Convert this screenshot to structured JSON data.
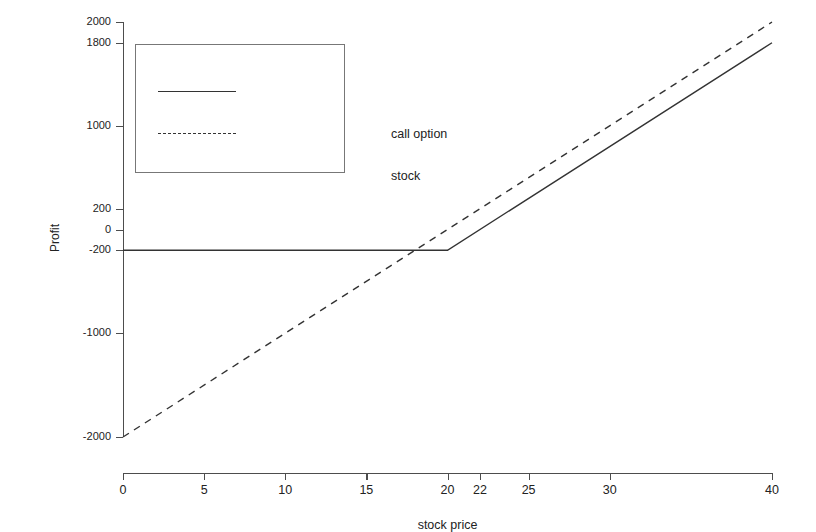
{
  "chart_data": {
    "type": "line",
    "title": "",
    "xlabel": "stock price",
    "ylabel": "Profit",
    "xlim": [
      0,
      40
    ],
    "ylim": [
      -2000,
      2000
    ],
    "grid": false,
    "legend_position": "upper left",
    "x_ticks": [
      0,
      5,
      10,
      15,
      20,
      22,
      25,
      30,
      40
    ],
    "x_tick_labels": [
      "0",
      "5",
      "10",
      "15",
      "20",
      "22",
      "25",
      "30",
      "40"
    ],
    "y_ticks": [
      2000,
      1800,
      1000,
      200,
      0,
      -200,
      -1000,
      -2000
    ],
    "y_tick_labels": [
      "2000",
      "1800",
      "1000",
      "200",
      "0",
      "-200",
      "-1000",
      "-2000"
    ],
    "series": [
      {
        "name": "call option",
        "style": "solid",
        "color": "#333333",
        "points": [
          [
            0,
            -200
          ],
          [
            20,
            -200
          ],
          [
            40,
            1800
          ]
        ]
      },
      {
        "name": "stock",
        "style": "dashed",
        "color": "#333333",
        "points": [
          [
            0,
            -2000
          ],
          [
            40,
            2000
          ]
        ]
      }
    ],
    "annotations": []
  },
  "legend": {
    "entries": [
      {
        "label": "call option",
        "style": "solid"
      },
      {
        "label": "stock",
        "style": "dashed"
      }
    ]
  },
  "axes": {
    "x_title": "stock price",
    "y_title": "Profit"
  },
  "colors": {
    "axis": "#4d4d4d",
    "line": "#333333",
    "text": "#222222",
    "background": "#ffffff"
  }
}
